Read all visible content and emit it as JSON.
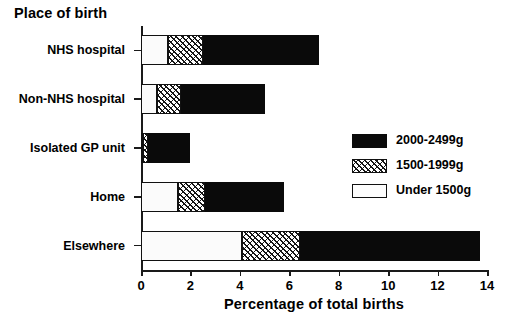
{
  "chart_data": {
    "type": "bar",
    "orientation": "horizontal",
    "stacked": true,
    "title": "Place of birth",
    "xlabel": "Percentage of total births",
    "ylabel": "",
    "xlim": [
      0,
      14
    ],
    "xticks": [
      0,
      2,
      4,
      6,
      8,
      10,
      12,
      14
    ],
    "xtick_labels": [
      "0",
      "2",
      "4",
      "6",
      "8",
      "10",
      "12",
      "14"
    ],
    "grid": false,
    "legend_position": "center-right",
    "categories": [
      "NHS hospital",
      "Non-NHS hospital",
      "Isolated GP unit",
      "Home",
      "Elsewhere"
    ],
    "series": [
      {
        "name": "Under 1500g",
        "fill": "white",
        "color": "#fbfbfb",
        "values": [
          1.1,
          0.65,
          0.1,
          1.5,
          4.1
        ]
      },
      {
        "name": "1500-1999g",
        "fill": "hatched",
        "color": "#151515",
        "values": [
          1.4,
          0.95,
          0.2,
          1.1,
          2.35
        ]
      },
      {
        "name": "2000-2499g",
        "fill": "solid-black",
        "color": "#0a0a0a",
        "values": [
          4.7,
          3.4,
          1.7,
          3.2,
          7.25
        ]
      }
    ],
    "cumulative_totals": [
      7.2,
      5.0,
      2.0,
      5.8,
      13.7
    ]
  },
  "legend": {
    "entries": [
      {
        "label": "2000-2499g",
        "style": "top"
      },
      {
        "label": "1500-1999g",
        "style": "mid"
      },
      {
        "label": "Under 1500g",
        "style": "under"
      }
    ]
  }
}
